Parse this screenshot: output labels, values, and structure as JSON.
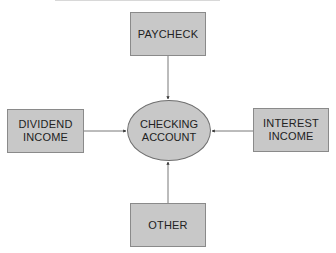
{
  "diagram": {
    "center": {
      "line1": "CHECKING",
      "line2": "ACCOUNT"
    },
    "nodes": {
      "paycheck": {
        "line1": "PAYCHECK"
      },
      "dividend": {
        "line1": "DIVIDEND",
        "line2": "INCOME"
      },
      "interest": {
        "line1": "INTEREST",
        "line2": "INCOME"
      },
      "other": {
        "line1": "OTHER"
      }
    },
    "edges": [
      {
        "from": "PAYCHECK",
        "to": "CHECKING ACCOUNT"
      },
      {
        "from": "DIVIDEND INCOME",
        "to": "CHECKING ACCOUNT"
      },
      {
        "from": "INTEREST INCOME",
        "to": "CHECKING ACCOUNT"
      },
      {
        "from": "OTHER",
        "to": "CHECKING ACCOUNT"
      }
    ],
    "colors": {
      "fill": "#c8c8c8",
      "border": "#8a8a8a",
      "line": "#555555"
    }
  }
}
